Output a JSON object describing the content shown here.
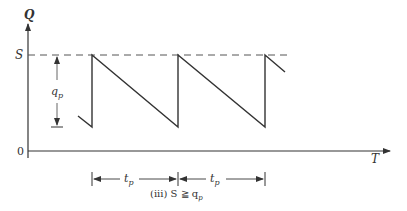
{
  "diagram": {
    "y_axis_label": "Q",
    "x_axis_label": "T",
    "origin_label": "0",
    "level_label": "S",
    "height_label": "q",
    "height_sub": "p",
    "period_label": "t",
    "period_sub": "p",
    "caption_prefix": "(iii) S ≧ q",
    "caption_sub": "p",
    "colors": {
      "line": "#333333",
      "dashed": "#555555",
      "background": "#ffffff"
    }
  }
}
